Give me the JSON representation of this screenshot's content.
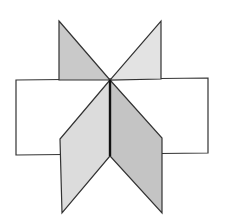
{
  "figure": {
    "colors": {
      "background": "#ffffff",
      "stroke": "#333333",
      "rect_fill": "#ffffff",
      "upper_left_fill": "#c9c9c9",
      "upper_right_fill": "#e3e3e3",
      "lower_left_fill": "#dcdcdc",
      "lower_right_fill": "#c4c4c4",
      "center_edge": "#111111"
    },
    "shapes": {
      "rectangle": "16,80 208,78 208,153 16,155",
      "upper_left_triangle": "59,21 110,80 59,80",
      "upper_right_triangle": "161,21 161,79 110,80",
      "lower_left_parallelogram": "110,80 110,156 62,213 60,139",
      "lower_right_parallelogram": "110,80 162,138 162,213 110,156",
      "center_edge": "110,80 110,156"
    }
  }
}
